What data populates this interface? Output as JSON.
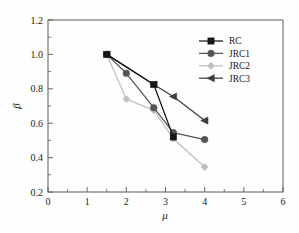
{
  "chart_data": {
    "type": "line",
    "title": "",
    "subtitle": "",
    "xlabel": "μ",
    "ylabel": "β",
    "xlim": [
      0,
      6
    ],
    "ylim": [
      0.2,
      1.2
    ],
    "xticks": [
      0,
      1,
      2,
      3,
      4,
      5,
      6
    ],
    "xtick_labels": [
      "0",
      "1",
      "2",
      "3",
      "4",
      "5",
      "6"
    ],
    "x_minor_tick_step": 0.5,
    "yticks": [
      0.2,
      0.4,
      0.6,
      0.8,
      1.0,
      1.2
    ],
    "ytick_labels": [
      "0.2",
      "0.4",
      "0.6",
      "0.8",
      "1.0",
      "1.2"
    ],
    "y_minor_tick_step": 0.1,
    "grid": false,
    "legend_position": "upper right",
    "series": [
      {
        "name": "RC",
        "marker": "square",
        "color": "#171717",
        "x": [
          1.5,
          2.7,
          3.2
        ],
        "y": [
          1.0,
          0.825,
          0.52
        ]
      },
      {
        "name": "JRC1",
        "marker": "circle",
        "color": "#555555",
        "x": [
          1.5,
          2.0,
          2.7,
          3.2,
          4.0
        ],
        "y": [
          1.0,
          0.89,
          0.69,
          0.545,
          0.505
        ]
      },
      {
        "name": "JRC2",
        "marker": "diamond",
        "color": "#bfbfbf",
        "x": [
          1.5,
          2.0,
          2.7,
          3.2,
          4.0
        ],
        "y": [
          1.0,
          0.74,
          0.675,
          0.51,
          0.345
        ]
      },
      {
        "name": "JRC3",
        "marker": "triangle-left",
        "color": "#3d3d3d",
        "x": [
          1.5,
          2.7,
          3.2,
          4.0
        ],
        "y": [
          1.0,
          0.825,
          0.755,
          0.615
        ]
      }
    ]
  },
  "legend": {
    "entries": [
      {
        "label": "RC"
      },
      {
        "label": "JRC1"
      },
      {
        "label": "JRC2"
      },
      {
        "label": "JRC3"
      }
    ]
  },
  "axes": {
    "x_axis_title": "μ",
    "y_axis_title": "β"
  },
  "colors": {
    "frame": "#5a5a5a",
    "text": "#1a1a1a",
    "background": "#fefefe",
    "series_rc": "#171717",
    "series_jrc1": "#555555",
    "series_jrc2": "#bfbfbf",
    "series_jrc3": "#3d3d3d"
  }
}
